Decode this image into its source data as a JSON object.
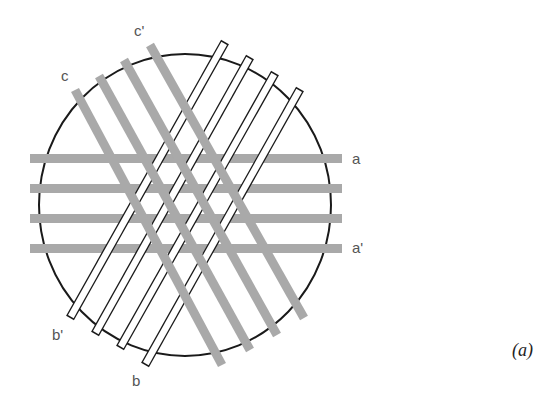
{
  "diagram": {
    "caption": "(a)",
    "colors": {
      "gray_bar": "#a9a9a9",
      "outline": "#1a1a1a",
      "white_bar": "#ffffff",
      "label": "#555555"
    },
    "circle": {
      "cx": 185,
      "cy": 205,
      "rx": 146,
      "ry": 151
    },
    "labels": {
      "a": "a",
      "a_prime": "a'",
      "b": "b",
      "b_prime": "b'",
      "c": "c",
      "c_prime": "c'"
    },
    "bar_sets": [
      {
        "name": "a",
        "style": "gray",
        "count": 4,
        "direction": "horizontal"
      },
      {
        "name": "b",
        "style": "white-outlined",
        "count": 4,
        "direction": "diagonal-up-right"
      },
      {
        "name": "c",
        "style": "gray",
        "count": 4,
        "direction": "diagonal-down-right"
      }
    ]
  }
}
